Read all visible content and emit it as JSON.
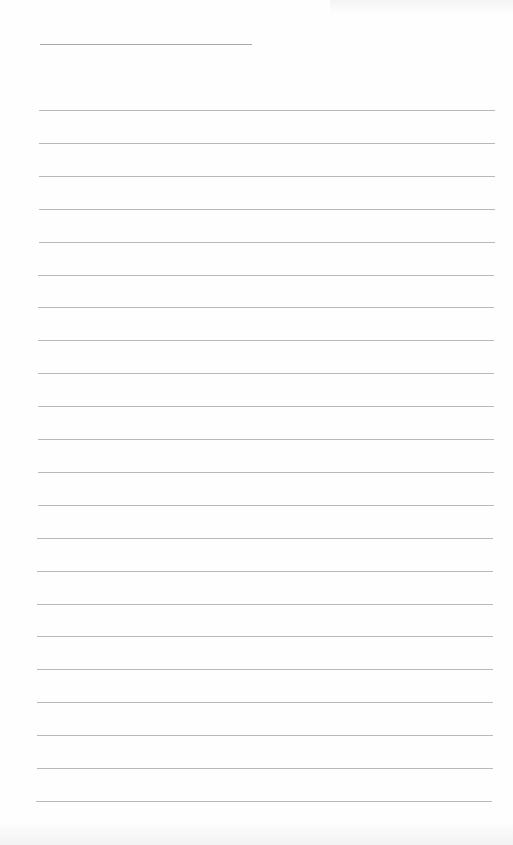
{
  "page": {
    "type": "lined-paper",
    "background_color": "#fefefe",
    "line_color": "#b9b9b9"
  },
  "header_line": {
    "x": 40,
    "y": 44,
    "width": 212
  },
  "ruled_lines": {
    "count": 22,
    "x": 39,
    "width": 456,
    "start_y": 110,
    "spacing": 32.9
  }
}
